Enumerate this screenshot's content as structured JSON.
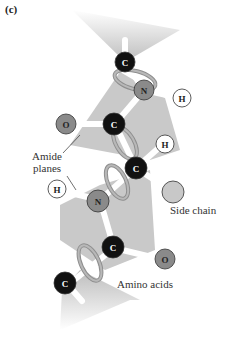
{
  "figure": {
    "panel_label": "(c)",
    "labels": {
      "amide_planes_line1": "Amide",
      "amide_planes_line2": "planes",
      "side_chain": "Side chain",
      "amino_acids": "Amino acids"
    },
    "atoms": [
      {
        "id": "c-top",
        "element": "C",
        "color": "#111111"
      },
      {
        "id": "n-top",
        "element": "N",
        "color": "#8a8a8a"
      },
      {
        "id": "h-top",
        "element": "H",
        "color": "#ffffff"
      },
      {
        "id": "o-left",
        "element": "O",
        "color": "#8a8a8a"
      },
      {
        "id": "c-carbonyl-1",
        "element": "C",
        "color": "#111111"
      },
      {
        "id": "c-alpha",
        "element": "C",
        "color": "#111111"
      },
      {
        "id": "h-alpha",
        "element": "H",
        "color": "#ffffff"
      },
      {
        "id": "side-chain",
        "element": "",
        "color": "#c8c8c8"
      },
      {
        "id": "h-n",
        "element": "H",
        "color": "#ffffff"
      },
      {
        "id": "n-mid",
        "element": "N",
        "color": "#8a8a8a"
      },
      {
        "id": "c-carbonyl-2",
        "element": "C",
        "color": "#111111"
      },
      {
        "id": "o-right",
        "element": "O",
        "color": "#8a8a8a"
      },
      {
        "id": "c-bottom",
        "element": "C",
        "color": "#111111"
      }
    ],
    "colors": {
      "plane": "#c4c4c4",
      "bond": "#ffffff",
      "rotation_arrow": "#9a9a9a"
    }
  }
}
